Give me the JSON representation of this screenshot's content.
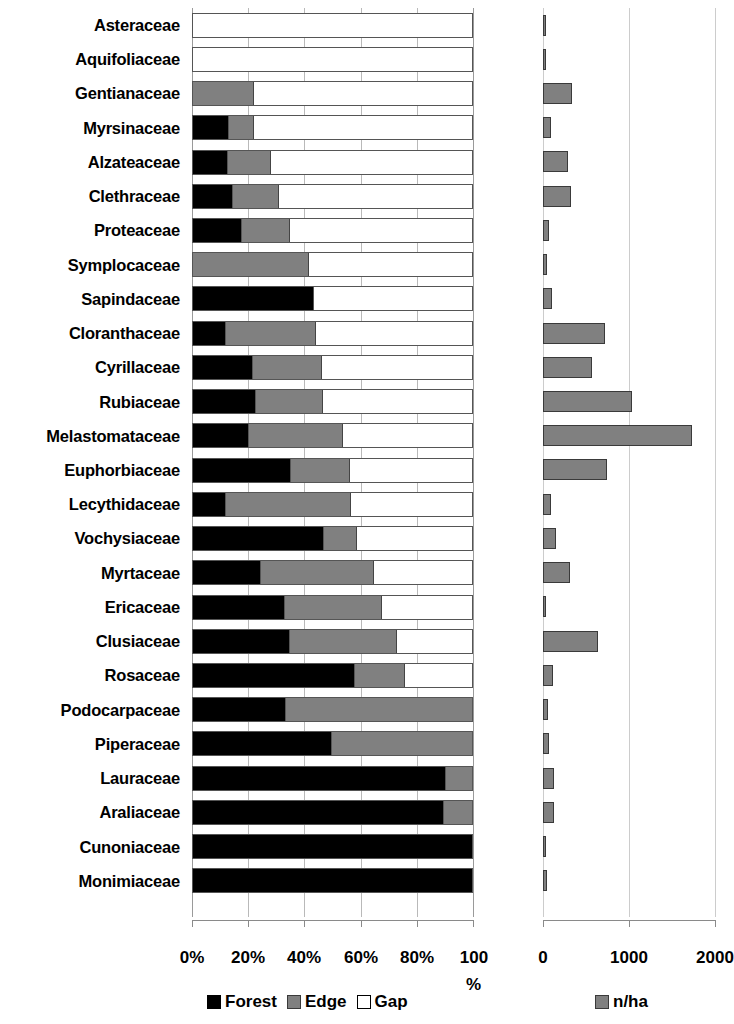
{
  "chart_data": {
    "type": "bar",
    "title": "",
    "subtitle": "",
    "orientation": "horizontal",
    "panels": [
      {
        "name": "habitat-composition",
        "type": "bar",
        "stacked": true,
        "stack_mode": "percent",
        "xlabel": "%",
        "ylabel": "",
        "xlim": [
          0,
          100
        ],
        "xticks": [
          0,
          20,
          40,
          60,
          80,
          100
        ],
        "xtick_labels": [
          "0%",
          "20%",
          "40%",
          "60%",
          "80%",
          "100"
        ],
        "xtick_suffix": "%",
        "grid": true,
        "legend_position": "bottom",
        "series": [
          {
            "name": "Forest",
            "color": "#000000",
            "values": [
              0,
              0,
              0,
              12.8,
              12.5,
              14.2,
              17.4,
              0,
              43.1,
              11.7,
              21.4,
              22.4,
              19.9,
              34.9,
              11.7,
              46.6,
              24.2,
              32.7,
              34.5,
              57.7,
              33.1,
              49.5,
              90.0,
              89.3,
              100.0,
              100.0
            ]
          },
          {
            "name": "Edge",
            "color": "#808080",
            "values": [
              0,
              0,
              21.7,
              8.9,
              15.3,
              16.4,
              17.1,
              41.3,
              0,
              32.0,
              24.6,
              23.8,
              33.5,
              21.0,
              44.5,
              11.7,
              40.2,
              34.5,
              38.1,
              17.8,
              66.9,
              50.5,
              10.0,
              10.7,
              0,
              0
            ]
          },
          {
            "name": "Gap",
            "color": "#ffffff",
            "values": [
              100.0,
              100.0,
              78.3,
              78.3,
              72.2,
              69.4,
              65.5,
              58.7,
              56.9,
              56.3,
              54.0,
              53.8,
              46.6,
              44.1,
              43.8,
              41.7,
              35.6,
              32.8,
              27.4,
              24.5,
              0,
              0,
              0,
              0,
              0,
              0
            ]
          }
        ]
      },
      {
        "name": "density",
        "type": "bar",
        "stacked": false,
        "xlabel": "",
        "ylabel": "",
        "xlim": [
          0,
          2000
        ],
        "xticks": [
          0,
          1000,
          2000
        ],
        "xtick_labels": [
          "0",
          "1000",
          "2000"
        ],
        "grid": true,
        "legend_position": "bottom",
        "series": [
          {
            "name": "n/ha",
            "color": "#808080",
            "values": [
              12,
              12,
              340,
              95,
              290,
              320,
              65,
              50,
              110,
              720,
              570,
              1030,
              1730,
              740,
              90,
              155,
              310,
              35,
              640,
              120,
              60,
              75,
              130,
              130,
              5,
              45
            ]
          }
        ]
      }
    ],
    "categories": [
      "Asteraceae",
      "Aquifoliaceae",
      "Gentianaceae",
      "Myrsinaceae",
      "Alzateaceae",
      "Clethraceae",
      "Proteaceae",
      "Symplocaceae",
      "Sapindaceae",
      "Cloranthaceae",
      "Cyrillaceae",
      "Rubiaceae",
      "Melastomataceae",
      "Euphorbiaceae",
      "Lecythidaceae",
      "Vochysiaceae",
      "Myrtaceae",
      "Ericaceae",
      "Clusiaceae",
      "Rosaceae",
      "Podocarpaceae",
      "Piperaceae",
      "Lauraceae",
      "Araliaceae",
      "Cunoniaceae",
      "Monimiaceae"
    ]
  },
  "left_panel": {
    "tick_labels": [
      "0%",
      "20%",
      "40%",
      "60%",
      "80%",
      "100"
    ],
    "unit_suffix": "%",
    "legend": [
      {
        "label": "Forest",
        "swatch": "forest-swatch",
        "color": "#000000"
      },
      {
        "label": "Edge",
        "swatch": "edge-swatch",
        "color": "#808080"
      },
      {
        "label": "Gap",
        "swatch": "gap-swatch",
        "color": "#ffffff"
      }
    ]
  },
  "right_panel": {
    "tick_labels": [
      "0",
      "1000",
      "2000"
    ],
    "legend": [
      {
        "label": "n/ha",
        "swatch": "nha-swatch",
        "color": "#808080"
      }
    ]
  }
}
